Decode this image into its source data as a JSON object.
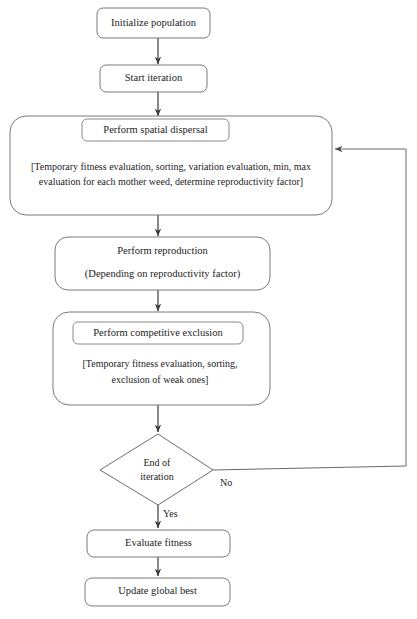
{
  "diagram": {
    "colors": {
      "background": "#ffffff",
      "node_border": "#7a7a7a",
      "inner_border": "#8a8a8a",
      "arrow": "#3a3a3a",
      "loop": "#6a6a6a",
      "text": "#1c1c1c"
    },
    "nodes": {
      "initialize": {
        "label": "Initialize population"
      },
      "start_iteration": {
        "label": "Start iteration"
      },
      "spatial_dispersal": {
        "header": "Perform spatial dispersal",
        "detail_line1": "[Temporary fitness evaluation, sorting, variation evaluation, min, max",
        "detail_line2": "evaluation for each mother weed, determine reproductivity factor]"
      },
      "reproduction": {
        "line1": "Perform reproduction",
        "line2": "(Depending on reproductivity factor)"
      },
      "competitive_exclusion": {
        "header": "Perform competitive exclusion",
        "detail_line1": "[Temporary fitness evaluation, sorting,",
        "detail_line2": "exclusion of weak ones]"
      },
      "decision": {
        "line1": "End of",
        "line2": "iteration"
      },
      "evaluate_fitness": {
        "label": "Evaluate fitness"
      },
      "update_global_best": {
        "label": "Update global best"
      }
    },
    "edge_labels": {
      "yes": "Yes",
      "no": "No"
    }
  }
}
